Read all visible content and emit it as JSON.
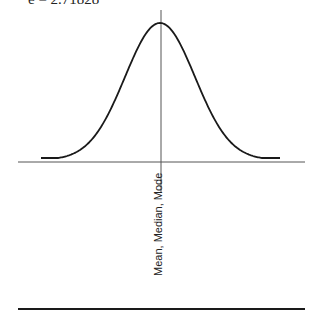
{
  "equation_text": "e = 2.71828",
  "center_label": "Mean, Median, Mode",
  "colors": {
    "curve": "#1a1a1a",
    "axis": "#555555",
    "baseline": "#1a1a1a",
    "background": "#ffffff"
  },
  "diagram": {
    "type": "normal-distribution-curve",
    "peak": {
      "x": 160,
      "y": 23
    },
    "sigma_px": 35,
    "curve_ends": {
      "left_x": 41,
      "right_x": 280,
      "y": 158
    },
    "x_axis": {
      "y": 162,
      "x_start": 18,
      "x_end": 305
    },
    "center_line": {
      "x": 161,
      "y_start": 10,
      "y_end": 193
    },
    "bottom_rule": {
      "y": 309,
      "x_start": 18,
      "x_end": 305
    }
  }
}
